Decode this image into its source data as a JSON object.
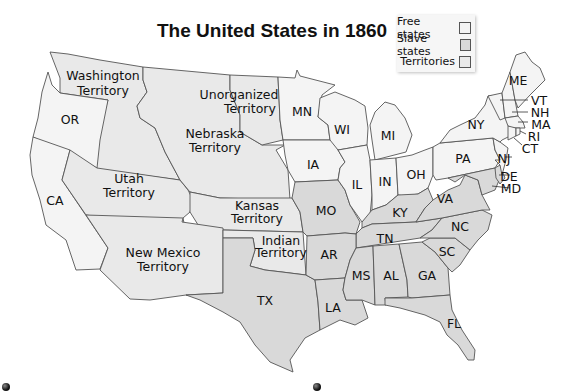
{
  "title": "The United States in 1860",
  "legend": {
    "items": [
      {
        "label": "Free states",
        "color": "#f4f4f4"
      },
      {
        "label": "Slave states",
        "color": "#d9d9d9"
      },
      {
        "label": "Territories",
        "color": "#e9e9e9"
      }
    ]
  },
  "regions": {
    "washington": {
      "line1": "Washington",
      "line2": "Territory",
      "status": "territory"
    },
    "oregon": {
      "label": "OR",
      "status": "free"
    },
    "unorganized": {
      "line1": "Unorganized",
      "line2": "Territory",
      "status": "territory"
    },
    "nebraska": {
      "line1": "Nebraska",
      "line2": "Territory",
      "status": "territory"
    },
    "utah": {
      "line1": "Utah",
      "line2": "Territory",
      "status": "territory"
    },
    "california": {
      "label": "CA",
      "status": "free"
    },
    "kansas": {
      "line1": "Kansas",
      "line2": "Territory",
      "status": "territory"
    },
    "new_mexico": {
      "line1": "New Mexico",
      "line2": "Territory",
      "status": "territory"
    },
    "indian": {
      "line1": "Indian",
      "line2": "Territory",
      "status": "territory"
    },
    "minnesota": {
      "label": "MN",
      "status": "free"
    },
    "wisconsin": {
      "label": "WI",
      "status": "free"
    },
    "michigan": {
      "label": "MI",
      "status": "free"
    },
    "iowa": {
      "label": "IA",
      "status": "free"
    },
    "illinois": {
      "label": "IL",
      "status": "free"
    },
    "indiana": {
      "label": "IN",
      "status": "free"
    },
    "ohio": {
      "label": "OH",
      "status": "free"
    },
    "pennsylvania": {
      "label": "PA",
      "status": "free"
    },
    "new_york": {
      "label": "NY",
      "status": "free"
    },
    "maine": {
      "label": "ME",
      "status": "free"
    },
    "vermont": {
      "label": "VT",
      "status": "free"
    },
    "new_hampshire": {
      "label": "NH",
      "status": "free"
    },
    "massachusetts": {
      "label": "MA",
      "status": "free"
    },
    "rhode_island": {
      "label": "RI",
      "status": "free"
    },
    "connecticut": {
      "label": "CT",
      "status": "free"
    },
    "new_jersey": {
      "label": "NJ",
      "status": "free"
    },
    "delaware": {
      "label": "DE",
      "status": "slave"
    },
    "maryland": {
      "label": "MD",
      "status": "slave"
    },
    "missouri": {
      "label": "MO",
      "status": "slave"
    },
    "kentucky": {
      "label": "KY",
      "status": "slave"
    },
    "virginia": {
      "label": "VA",
      "status": "slave"
    },
    "north_carolina": {
      "label": "NC",
      "status": "slave"
    },
    "tennessee": {
      "label": "TN",
      "status": "slave"
    },
    "south_carolina": {
      "label": "SC",
      "status": "slave"
    },
    "arkansas": {
      "label": "AR",
      "status": "slave"
    },
    "mississippi": {
      "label": "MS",
      "status": "slave"
    },
    "alabama": {
      "label": "AL",
      "status": "slave"
    },
    "georgia": {
      "label": "GA",
      "status": "slave"
    },
    "louisiana": {
      "label": "LA",
      "status": "slave"
    },
    "texas": {
      "label": "TX",
      "status": "slave"
    },
    "florida": {
      "label": "FL",
      "status": "slave"
    }
  }
}
